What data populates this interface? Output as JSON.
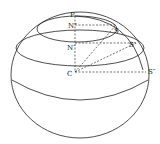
{
  "figure": {
    "type": "sphere-geometry",
    "labels": {
      "pole": "P",
      "upper_center": "N″",
      "middle_center": "N′",
      "sphere_center": "C",
      "upper_point": "S",
      "middle_point": "S′",
      "equator_point": "S″"
    },
    "colors": {
      "ink": "#222222",
      "background": "#ffffff"
    }
  }
}
